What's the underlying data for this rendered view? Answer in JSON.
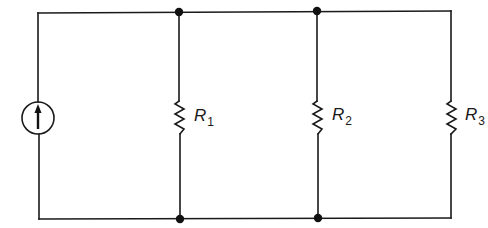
{
  "diagram": {
    "type": "circuit",
    "source": {
      "kind": "current-source",
      "direction": "up"
    },
    "resistors": [
      {
        "name": "R",
        "subscript": "1"
      },
      {
        "name": "R",
        "subscript": "2"
      },
      {
        "name": "R",
        "subscript": "3"
      }
    ],
    "nodes": [
      "top-node-1",
      "top-node-2",
      "bottom-node-1",
      "bottom-node-2"
    ],
    "colors": {
      "wire": "#1a1a1a",
      "background": "#ffffff"
    }
  }
}
